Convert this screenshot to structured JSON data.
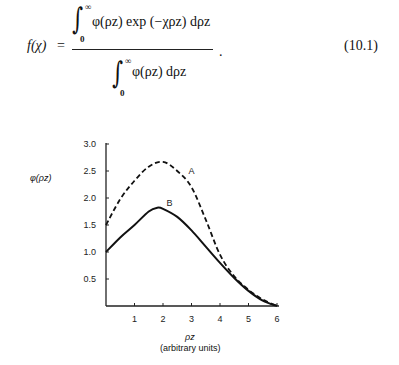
{
  "equation": {
    "lhs": "f(χ)",
    "equals": "=",
    "numerator": "φ(ρz) exp (−χρz) dρz",
    "denominator": "φ(ρz) dρz",
    "integral_lower": "0",
    "integral_upper": "∞",
    "trailing": ".",
    "number": "(10.1)"
  },
  "chart_data": {
    "type": "line",
    "title": "",
    "xlabel": "ρz",
    "xlabel_units": "(arbitrary units)",
    "ylabel": "φ(ρz)",
    "xlim": [
      0,
      6
    ],
    "ylim": [
      0,
      3.0
    ],
    "x_ticks": [
      1,
      2,
      3,
      4,
      5,
      6
    ],
    "y_ticks": [
      0.5,
      1.0,
      1.5,
      2.0,
      2.5,
      3.0
    ],
    "y_tick_labels": [
      "0.5",
      "1.0",
      "1.5",
      "2.0",
      "2.5",
      "3.0"
    ],
    "grid": false,
    "legend": "inline labels",
    "series": [
      {
        "name": "A",
        "style": "dashed",
        "x": [
          0,
          0.5,
          1,
          1.5,
          2,
          2.5,
          3,
          3.5,
          4,
          4.5,
          5,
          5.5,
          6
        ],
        "values": [
          1.5,
          1.98,
          2.32,
          2.58,
          2.67,
          2.5,
          2.2,
          1.6,
          0.95,
          0.55,
          0.3,
          0.12,
          0
        ]
      },
      {
        "name": "B",
        "style": "solid",
        "x": [
          0,
          0.5,
          1,
          1.5,
          1.8,
          2,
          2.5,
          3,
          3.5,
          4,
          4.5,
          5,
          5.5,
          6
        ],
        "values": [
          1.0,
          1.27,
          1.5,
          1.75,
          1.82,
          1.8,
          1.65,
          1.4,
          1.1,
          0.8,
          0.52,
          0.28,
          0.1,
          0
        ]
      }
    ]
  }
}
